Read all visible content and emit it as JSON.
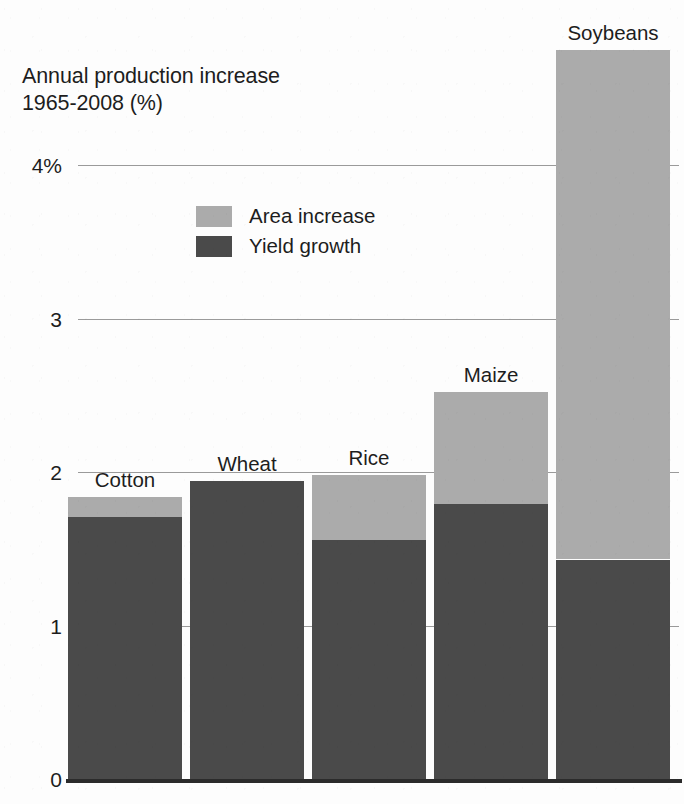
{
  "chart_data": {
    "type": "bar",
    "subtype": "stacked-bar",
    "title": "Annual production increase\n1965-2008 (%)",
    "xlabel": "",
    "ylabel": "",
    "ylim": [
      0,
      4.75
    ],
    "grid": true,
    "grid_axis": "y",
    "legend_position": "inside-upper-left",
    "categories": [
      "Cotton",
      "Wheat",
      "Rice",
      "Maize",
      "Soybeans"
    ],
    "y_ticks": [
      0,
      1,
      2,
      3,
      4
    ],
    "y_tick_labels": [
      "0",
      "1",
      "2",
      "3",
      "4%"
    ],
    "series": [
      {
        "name": "Yield growth",
        "color": "#4a4a4a",
        "values": [
          1.71,
          1.94,
          1.56,
          1.79,
          1.43
        ]
      },
      {
        "name": "Area increase",
        "color": "#ababab",
        "values": [
          0.13,
          0.0,
          0.42,
          0.73,
          3.32
        ]
      }
    ],
    "totals": [
      1.84,
      1.94,
      1.98,
      2.52,
      4.75
    ],
    "stack_order": [
      "Yield growth",
      "Area increase"
    ]
  },
  "axis": {
    "ticks": [
      {
        "label": "4%",
        "value": 4
      },
      {
        "label": "3",
        "value": 3
      },
      {
        "label": "2",
        "value": 2
      },
      {
        "label": "1",
        "value": 1
      },
      {
        "label": "0",
        "value": 0
      }
    ]
  },
  "legend": {
    "items": [
      {
        "label": "Area increase",
        "color": "#ababab"
      },
      {
        "label": "Yield growth",
        "color": "#4a4a4a"
      }
    ]
  },
  "bars": [
    {
      "label": "Cotton",
      "yield": 1.71,
      "area": 0.13,
      "total": 1.84
    },
    {
      "label": "Wheat",
      "yield": 1.94,
      "area": 0.0,
      "total": 1.94
    },
    {
      "label": "Rice",
      "yield": 1.56,
      "area": 0.42,
      "total": 1.98
    },
    {
      "label": "Maize",
      "yield": 1.79,
      "area": 0.73,
      "total": 2.52
    },
    {
      "label": "Soybeans",
      "yield": 1.43,
      "area": 3.32,
      "total": 4.75
    }
  ],
  "colors": {
    "area_increase": "#ababab",
    "yield_growth": "#4a4a4a",
    "gridline": "#9a9a9a",
    "baseline": "#2b2b2b",
    "text": "#1d1d1d",
    "background": "#fdfdfd"
  }
}
